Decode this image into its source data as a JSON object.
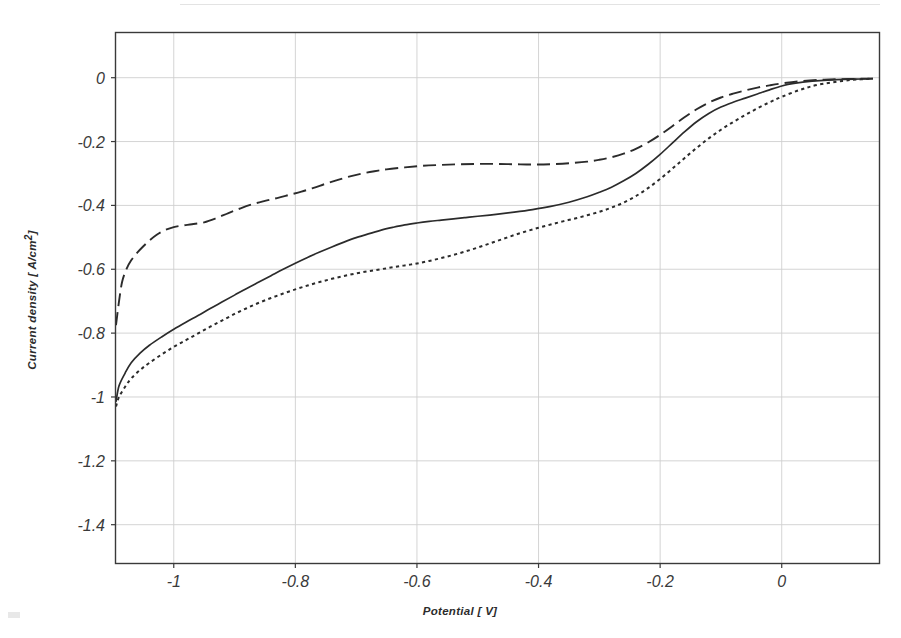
{
  "chart_data": {
    "type": "line",
    "title": "",
    "subtitle": "",
    "xlabel": "Potential [ V]",
    "ylabel_prefix": "Current density [ A/cm",
    "ylabel_sup": "2",
    "ylabel_suffix": "]",
    "ylabel_full": "Current density [ A/cm2]",
    "xlim": [
      -1.095,
      0.16
    ],
    "ylim": [
      -1.52,
      0.14
    ],
    "xticks": [
      -1,
      -0.8,
      -0.6,
      -0.4,
      -0.2,
      0
    ],
    "xticklabels": [
      "-1",
      "-0.8",
      "-0.6",
      "-0.4",
      "-0.2",
      "0"
    ],
    "yticks": [
      0,
      -0.2,
      -0.4,
      -0.6,
      -0.8,
      -1,
      -1.2,
      -1.4
    ],
    "yticklabels": [
      "0",
      "-0.2",
      "-0.4",
      "-0.6",
      "-0.8",
      "-1",
      "-1.2",
      "-1.4"
    ],
    "grid": true,
    "grid_color": "#cfcfcf",
    "axis_color": "#3a3a3a",
    "legend": "none",
    "series": [
      {
        "name": "solid-curve",
        "style": "solid",
        "color": "#2b2b2b",
        "points": [
          [
            -1.095,
            -1.015
          ],
          [
            -1.09,
            -0.965
          ],
          [
            -1.08,
            -0.925
          ],
          [
            -1.07,
            -0.893
          ],
          [
            -1.055,
            -0.862
          ],
          [
            -1.04,
            -0.838
          ],
          [
            -1.02,
            -0.812
          ],
          [
            -1.0,
            -0.788
          ],
          [
            -0.98,
            -0.766
          ],
          [
            -0.96,
            -0.745
          ],
          [
            -0.94,
            -0.723
          ],
          [
            -0.92,
            -0.702
          ],
          [
            -0.9,
            -0.681
          ],
          [
            -0.88,
            -0.66
          ],
          [
            -0.86,
            -0.64
          ],
          [
            -0.84,
            -0.62
          ],
          [
            -0.82,
            -0.6
          ],
          [
            -0.8,
            -0.581
          ],
          [
            -0.78,
            -0.563
          ],
          [
            -0.76,
            -0.546
          ],
          [
            -0.74,
            -0.53
          ],
          [
            -0.72,
            -0.515
          ],
          [
            -0.7,
            -0.501
          ],
          [
            -0.68,
            -0.489
          ],
          [
            -0.66,
            -0.478
          ],
          [
            -0.64,
            -0.469
          ],
          [
            -0.62,
            -0.461
          ],
          [
            -0.6,
            -0.455
          ],
          [
            -0.58,
            -0.45
          ],
          [
            -0.56,
            -0.446
          ],
          [
            -0.54,
            -0.442
          ],
          [
            -0.52,
            -0.438
          ],
          [
            -0.5,
            -0.434
          ],
          [
            -0.47,
            -0.428
          ],
          [
            -0.44,
            -0.421
          ],
          [
            -0.41,
            -0.413
          ],
          [
            -0.38,
            -0.403
          ],
          [
            -0.35,
            -0.39
          ],
          [
            -0.32,
            -0.373
          ],
          [
            -0.3,
            -0.359
          ],
          [
            -0.28,
            -0.343
          ],
          [
            -0.26,
            -0.323
          ],
          [
            -0.24,
            -0.3
          ],
          [
            -0.22,
            -0.272
          ],
          [
            -0.2,
            -0.24
          ],
          [
            -0.18,
            -0.205
          ],
          [
            -0.16,
            -0.17
          ],
          [
            -0.14,
            -0.138
          ],
          [
            -0.12,
            -0.112
          ],
          [
            -0.1,
            -0.092
          ],
          [
            -0.08,
            -0.077
          ],
          [
            -0.06,
            -0.064
          ],
          [
            -0.04,
            -0.051
          ],
          [
            -0.02,
            -0.038
          ],
          [
            0.0,
            -0.026
          ],
          [
            0.02,
            -0.018
          ],
          [
            0.05,
            -0.011
          ],
          [
            0.09,
            -0.006
          ],
          [
            0.13,
            -0.004
          ],
          [
            0.15,
            -0.003
          ]
        ]
      },
      {
        "name": "dashed-curve",
        "style": "dashed",
        "color": "#2b2b2b",
        "points": [
          [
            -1.095,
            -0.775
          ],
          [
            -1.09,
            -0.7
          ],
          [
            -1.085,
            -0.64
          ],
          [
            -1.078,
            -0.6
          ],
          [
            -1.07,
            -0.572
          ],
          [
            -1.06,
            -0.548
          ],
          [
            -1.05,
            -0.528
          ],
          [
            -1.04,
            -0.51
          ],
          [
            -1.028,
            -0.492
          ],
          [
            -1.015,
            -0.478
          ],
          [
            -1.0,
            -0.468
          ],
          [
            -0.985,
            -0.463
          ],
          [
            -0.97,
            -0.459
          ],
          [
            -0.95,
            -0.453
          ],
          [
            -0.93,
            -0.44
          ],
          [
            -0.91,
            -0.424
          ],
          [
            -0.89,
            -0.409
          ],
          [
            -0.87,
            -0.396
          ],
          [
            -0.85,
            -0.386
          ],
          [
            -0.83,
            -0.377
          ],
          [
            -0.81,
            -0.367
          ],
          [
            -0.79,
            -0.357
          ],
          [
            -0.77,
            -0.345
          ],
          [
            -0.75,
            -0.332
          ],
          [
            -0.73,
            -0.32
          ],
          [
            -0.71,
            -0.309
          ],
          [
            -0.69,
            -0.3
          ],
          [
            -0.67,
            -0.293
          ],
          [
            -0.65,
            -0.287
          ],
          [
            -0.62,
            -0.281
          ],
          [
            -0.59,
            -0.276
          ],
          [
            -0.56,
            -0.273
          ],
          [
            -0.53,
            -0.271
          ],
          [
            -0.5,
            -0.27
          ],
          [
            -0.47,
            -0.27
          ],
          [
            -0.44,
            -0.271
          ],
          [
            -0.41,
            -0.272
          ],
          [
            -0.38,
            -0.271
          ],
          [
            -0.35,
            -0.268
          ],
          [
            -0.32,
            -0.263
          ],
          [
            -0.3,
            -0.257
          ],
          [
            -0.28,
            -0.249
          ],
          [
            -0.26,
            -0.238
          ],
          [
            -0.24,
            -0.223
          ],
          [
            -0.22,
            -0.203
          ],
          [
            -0.2,
            -0.179
          ],
          [
            -0.18,
            -0.152
          ],
          [
            -0.16,
            -0.124
          ],
          [
            -0.14,
            -0.099
          ],
          [
            -0.12,
            -0.078
          ],
          [
            -0.1,
            -0.062
          ],
          [
            -0.08,
            -0.05
          ],
          [
            -0.06,
            -0.04
          ],
          [
            -0.04,
            -0.031
          ],
          [
            -0.02,
            -0.024
          ],
          [
            0.0,
            -0.018
          ],
          [
            0.03,
            -0.011
          ],
          [
            0.07,
            -0.006
          ],
          [
            0.11,
            -0.004
          ],
          [
            0.15,
            -0.003
          ]
        ]
      },
      {
        "name": "dotted-curve",
        "style": "dotted",
        "color": "#2b2b2b",
        "points": [
          [
            -1.095,
            -1.03
          ],
          [
            -1.09,
            -1.0
          ],
          [
            -1.08,
            -0.968
          ],
          [
            -1.07,
            -0.942
          ],
          [
            -1.055,
            -0.915
          ],
          [
            -1.04,
            -0.893
          ],
          [
            -1.02,
            -0.867
          ],
          [
            -1.0,
            -0.843
          ],
          [
            -0.98,
            -0.822
          ],
          [
            -0.96,
            -0.801
          ],
          [
            -0.94,
            -0.78
          ],
          [
            -0.92,
            -0.76
          ],
          [
            -0.9,
            -0.74
          ],
          [
            -0.88,
            -0.722
          ],
          [
            -0.86,
            -0.705
          ],
          [
            -0.84,
            -0.69
          ],
          [
            -0.82,
            -0.676
          ],
          [
            -0.8,
            -0.663
          ],
          [
            -0.78,
            -0.651
          ],
          [
            -0.76,
            -0.64
          ],
          [
            -0.74,
            -0.63
          ],
          [
            -0.72,
            -0.621
          ],
          [
            -0.7,
            -0.613
          ],
          [
            -0.68,
            -0.606
          ],
          [
            -0.66,
            -0.6
          ],
          [
            -0.64,
            -0.594
          ],
          [
            -0.62,
            -0.588
          ],
          [
            -0.6,
            -0.582
          ],
          [
            -0.58,
            -0.574
          ],
          [
            -0.56,
            -0.565
          ],
          [
            -0.54,
            -0.555
          ],
          [
            -0.52,
            -0.544
          ],
          [
            -0.5,
            -0.532
          ],
          [
            -0.48,
            -0.519
          ],
          [
            -0.46,
            -0.506
          ],
          [
            -0.44,
            -0.493
          ],
          [
            -0.42,
            -0.481
          ],
          [
            -0.4,
            -0.47
          ],
          [
            -0.38,
            -0.46
          ],
          [
            -0.36,
            -0.45
          ],
          [
            -0.34,
            -0.441
          ],
          [
            -0.32,
            -0.431
          ],
          [
            -0.3,
            -0.42
          ],
          [
            -0.28,
            -0.407
          ],
          [
            -0.26,
            -0.391
          ],
          [
            -0.24,
            -0.371
          ],
          [
            -0.22,
            -0.346
          ],
          [
            -0.2,
            -0.317
          ],
          [
            -0.18,
            -0.285
          ],
          [
            -0.16,
            -0.252
          ],
          [
            -0.14,
            -0.22
          ],
          [
            -0.12,
            -0.19
          ],
          [
            -0.1,
            -0.163
          ],
          [
            -0.08,
            -0.139
          ],
          [
            -0.06,
            -0.117
          ],
          [
            -0.04,
            -0.096
          ],
          [
            -0.02,
            -0.077
          ],
          [
            0.0,
            -0.06
          ],
          [
            0.03,
            -0.038
          ],
          [
            0.06,
            -0.022
          ],
          [
            0.1,
            -0.01
          ],
          [
            0.13,
            -0.005
          ],
          [
            0.15,
            -0.003
          ]
        ]
      }
    ]
  }
}
